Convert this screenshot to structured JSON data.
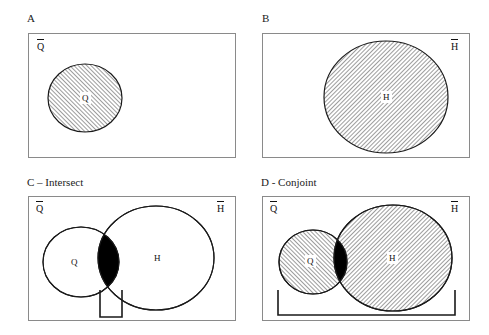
{
  "figure": {
    "background": "#ffffff",
    "outline_color": "#8a8a8a",
    "circle_stroke": "#1a1a1a",
    "hatch_color": "#4a4a4a",
    "intersection_fill": "#000000"
  },
  "panels": [
    {
      "id": "A",
      "title": "A",
      "universe_label_glyph": "Q",
      "universe_label_position": "left",
      "circles": [
        {
          "name": "Q",
          "label": "Q",
          "fill": "hatch",
          "hatch_direction": "forward"
        }
      ],
      "intersection_filled": false,
      "bracket": "none"
    },
    {
      "id": "B",
      "title": "B",
      "universe_label_glyph": "H",
      "universe_label_position": "right",
      "circles": [
        {
          "name": "H",
          "label": "H",
          "fill": "hatch",
          "hatch_direction": "backward"
        }
      ],
      "intersection_filled": false,
      "bracket": "none"
    },
    {
      "id": "C",
      "title": "C – Intersect",
      "universe_label_glyph_left": "Q",
      "universe_label_glyph_right": "H",
      "circles": [
        {
          "name": "Q",
          "label": "Q",
          "fill": "none",
          "hatch_direction": "none"
        },
        {
          "name": "H",
          "label": "H",
          "fill": "none",
          "hatch_direction": "none"
        }
      ],
      "intersection_filled": true,
      "bracket": "narrow"
    },
    {
      "id": "D",
      "title": "D - Conjoint",
      "universe_label_glyph_left": "Q",
      "universe_label_glyph_right": "H",
      "circles": [
        {
          "name": "Q",
          "label": "Q",
          "fill": "hatch",
          "hatch_direction": "forward"
        },
        {
          "name": "H",
          "label": "H",
          "fill": "hatch",
          "hatch_direction": "backward"
        }
      ],
      "intersection_filled": true,
      "bracket": "wide"
    }
  ],
  "labels": {
    "panel_a_title": "A",
    "panel_b_title": "B",
    "panel_c_title": "C – Intersect",
    "panel_d_title": "D - Conjoint",
    "q_universe": "Q",
    "h_universe": "H",
    "q_set": "Q",
    "h_set": "H"
  }
}
